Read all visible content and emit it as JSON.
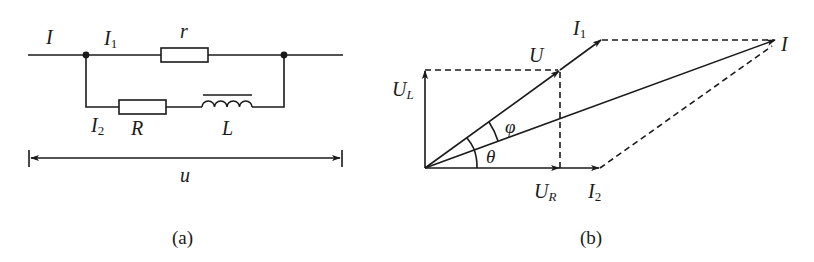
{
  "figure_a": {
    "caption": "(a)",
    "labels": {
      "I": "I",
      "I1_main": "I",
      "I1_sub": "1",
      "r": "r",
      "I2_main": "I",
      "I2_sub": "2",
      "R": "R",
      "L": "L",
      "u": "u"
    }
  },
  "figure_b": {
    "caption": "(b)",
    "labels": {
      "I1_main": "I",
      "I1_sub": "1",
      "U": "U",
      "I": "I",
      "UL_main": "U",
      "UL_sub": "L",
      "phi": "φ",
      "theta": "θ",
      "UR_main": "U",
      "UR_sub": "R",
      "I2_main": "I",
      "I2_sub": "2"
    }
  }
}
